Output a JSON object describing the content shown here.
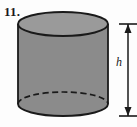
{
  "figure": {
    "problem_number": "11.",
    "shape_name": "cylinder",
    "height_label": "h",
    "colors": {
      "background": "#fdfdfd",
      "body_fill": "#8b8b8b",
      "top_fill": "#9a9a9a",
      "outline": "#1a1a1a",
      "hidden_edge": "#1a1a1a"
    },
    "geometry": {
      "center_x": 63,
      "top_ellipse_cy": 24,
      "bottom_ellipse_cy": 104,
      "radius_x": 45,
      "radius_y": 12,
      "dimension_line_x": 128,
      "dimension_top_y": 24,
      "dimension_bottom_y": 116
    },
    "annotations": {
      "hidden_edge_style": "dashed",
      "visible_edge_style": "solid",
      "dimension_arrows": "both-ends"
    }
  }
}
